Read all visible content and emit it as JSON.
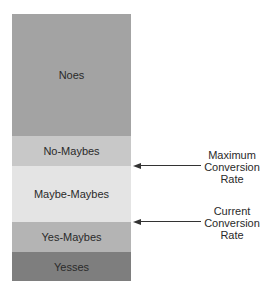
{
  "segments": [
    {
      "label": "Noes",
      "color": "#a3a3a3"
    },
    {
      "label": "No-Maybes",
      "color": "#c8c8c8"
    },
    {
      "label": "Maybe-Maybes",
      "color": "#e4e4e4"
    },
    {
      "label": "Yes-Maybes",
      "color": "#b4b4b4"
    },
    {
      "label": "Yesses",
      "color": "#7e7e7e"
    }
  ],
  "annotations": [
    {
      "lines": [
        "Maximum",
        "Conversion",
        "Rate"
      ]
    },
    {
      "lines": [
        "Current",
        "Conversion",
        "Rate"
      ]
    }
  ]
}
